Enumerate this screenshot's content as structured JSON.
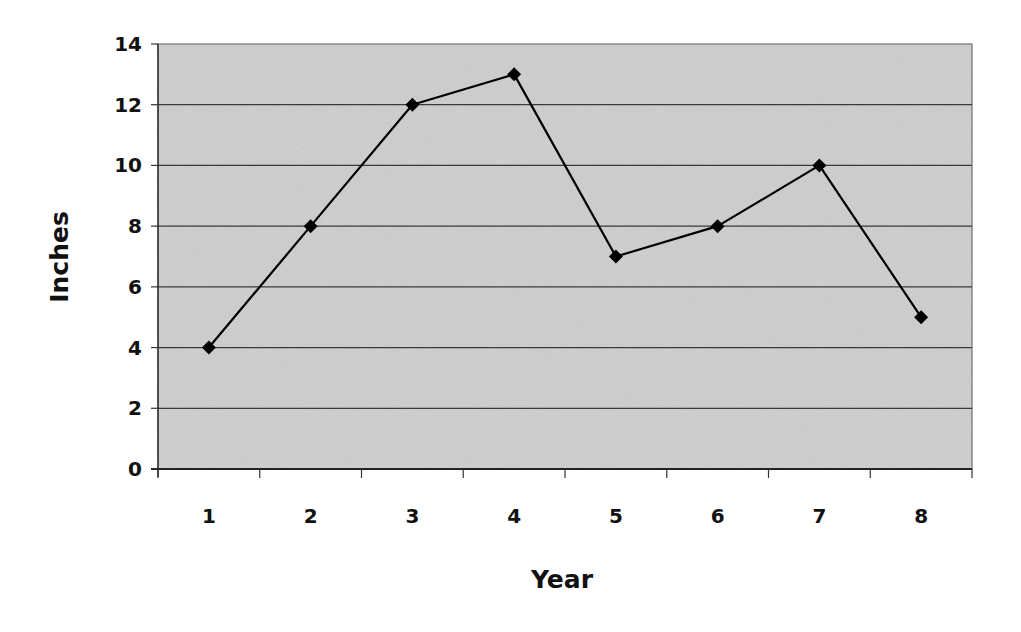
{
  "chart_data": {
    "type": "line",
    "title": "",
    "xlabel": "Year",
    "ylabel": "Inches",
    "categories": [
      "1",
      "2",
      "3",
      "4",
      "5",
      "6",
      "7",
      "8"
    ],
    "series": [
      {
        "name": "Inches",
        "values": [
          4,
          8,
          12,
          13,
          7,
          8,
          10,
          5
        ],
        "marker": "diamond",
        "color": "#000000"
      }
    ],
    "ylim": [
      0,
      14
    ],
    "yticks": [
      0,
      2,
      4,
      6,
      8,
      10,
      12,
      14
    ],
    "grid": true,
    "legend": "none",
    "plot_background": "#d4d4d4"
  }
}
